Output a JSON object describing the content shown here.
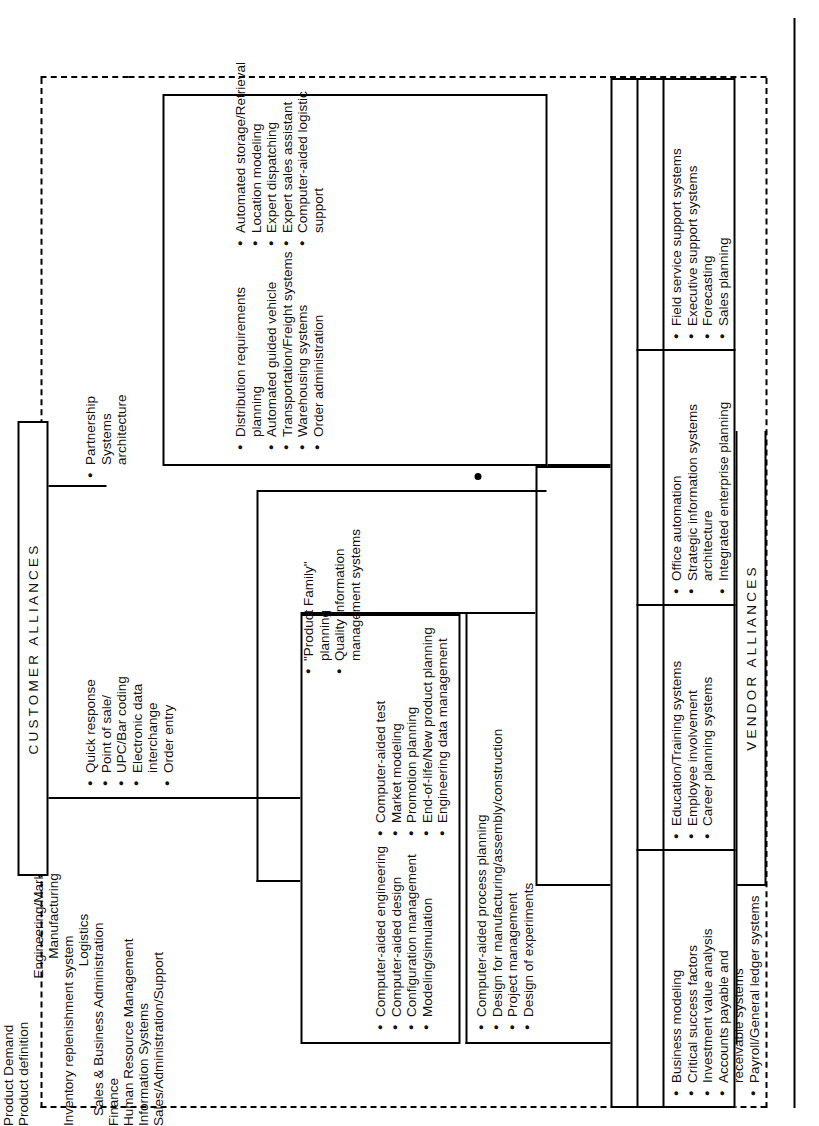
{
  "diagram": {
    "banners": {
      "customer_alliances": "CUSTOMER ALLIANCES",
      "vendor_alliances": "VENDOR ALLIANCES"
    },
    "flows": {
      "product_demand": "Product  Demand",
      "product_definition": "Product definition",
      "inventory_replenishment": "Inventory replenishment system",
      "electronic_data_interchange": "Electronic data interchange",
      "quality_information_management": "Quality information",
      "quality_information_management_2": "management systems",
      "systems_architecture": "Systems architecture"
    },
    "product_demand_items": [
      "Quick response",
      "Point of sale/",
      "UPC/Bar coding",
      "Electronic data",
      "interchange",
      "Order entry"
    ],
    "partnership_items": [
      "Partnership",
      "Systems",
      "architecture"
    ],
    "engineering_marketing": {
      "title": "Engineering/Marketing",
      "left_items": [
        "Computer-aided engineering",
        "Computer-aided design",
        "Configuration management",
        "Modeling/simulation"
      ],
      "right_items": [
        "Computer-aided test",
        "Market modeling",
        "Promotion  planning",
        "End-of-life/New product planning",
        "Engineering data management"
      ]
    },
    "bridge_items": [
      "Computer-aided process planning",
      "Design for manufacturing/assembly/construction",
      "Project management",
      "Design of experiments"
    ],
    "manufacturing": {
      "title": "Manufacturing",
      "left_items": [
        "Computer integrated",
        "manufacturing",
        "MRP II",
        "Flexible  manufacturing systems",
        "Quality control systems",
        "Factory data collection"
      ],
      "right_items": [
        "Manufacturing network",
        "(MAP/LAN)",
        "Shop floor control",
        "Robotics/CAM",
        "Statistical process control",
        "Expert systems",
        "Pull systems"
      ]
    },
    "product_family": {
      "items": [
        "\"Product Family\"",
        "planning",
        "Quality information",
        "management systems"
      ]
    },
    "logistics": {
      "title": "Logistics",
      "left_items": [
        "Distribution requirements",
        "planning",
        "Automated guided vehicle",
        "Transportation/Freight systems",
        "Warehousing systems",
        "Order administration"
      ],
      "right_items": [
        "Automated storage/Retrieval",
        "Location  modeling",
        "Expert  dispatching",
        "Expert  sales  assistant",
        "Computer-aided  logistic",
        "support"
      ]
    },
    "sales_business_administration": {
      "title": "Sales & Business  Administration",
      "columns": [
        {
          "name": "Finance",
          "items": [
            "Business modeling",
            "Critical  success  factors",
            "Investment value   analysis",
            "Accounts  payable  and",
            "receivable systems",
            "Payroll/General  ledger systems"
          ]
        },
        {
          "name": "Human  Resource  Management",
          "items": [
            "Education/Training systems",
            "Employee involvement",
            "Career  planning systems"
          ]
        },
        {
          "name": "Information Systems",
          "items": [
            "Office  automation",
            "Strategic information systems",
            "architecture",
            "Integrated enterprise  planning"
          ]
        },
        {
          "name": "Sales/Administration/Support",
          "items": [
            "Field service support systems",
            "Executive support systems",
            "Forecasting",
            "Sales planning"
          ]
        }
      ]
    }
  }
}
